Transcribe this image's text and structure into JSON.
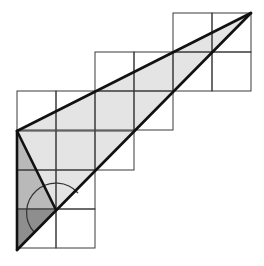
{
  "diagram": {
    "cell_size": 39,
    "origin": {
      "x": 17,
      "y": 13
    },
    "grid_rows": [
      {
        "row": 0,
        "cols": [
          4,
          5
        ]
      },
      {
        "row": 1,
        "cols": [
          2,
          3,
          4,
          5
        ]
      },
      {
        "row": 2,
        "cols": [
          0,
          1,
          2,
          3
        ]
      },
      {
        "row": 3,
        "cols": [
          0,
          1,
          2
        ]
      },
      {
        "row": 4,
        "cols": [
          0,
          1
        ]
      },
      {
        "row": 5,
        "cols": [
          0,
          1
        ]
      }
    ],
    "points": {
      "A": {
        "x": 17,
        "y": 131
      },
      "B": {
        "x": 251,
        "y": 13
      },
      "C": {
        "x": 17,
        "y": 250
      },
      "D": {
        "x": 56,
        "y": 210
      }
    },
    "colors": {
      "grid": "#333333",
      "light_fill": "#e6e6e6",
      "mid_fill": "#b8b8b8",
      "dark_fill": "#8c8c8c",
      "line": "#1a1a1a"
    }
  }
}
